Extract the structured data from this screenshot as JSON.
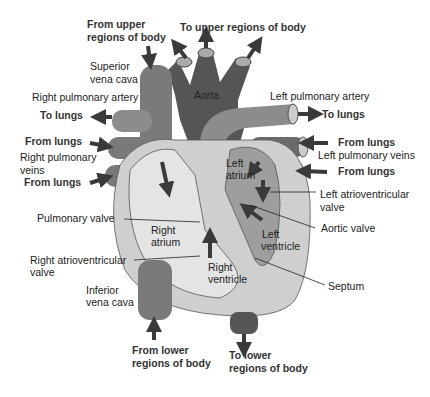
{
  "colors": {
    "background": "#ffffff",
    "deoxygenated_vessel": "#7a7a7a",
    "oxygenated_vessel": "#555555",
    "pulmonary_artery": "#8c8c8c",
    "heart_outer": "#cfcfcf",
    "heart_inner": "#e4e4e4",
    "left_chamber": "#9e9e9e",
    "arrow": "#3a3a3a",
    "text": "#222222"
  },
  "labels": {
    "from_upper_1": "From upper",
    "from_upper_2": "regions of body",
    "to_upper": "To upper regions of body",
    "superior_vc_1": "Superior",
    "superior_vc_2": "vena cava",
    "aorta": "Aorta",
    "right_pulm_artery": "Right pulmonary artery",
    "left_pulm_artery": "Left pulmonary artery",
    "to_lungs_left": "To lungs",
    "to_lungs_right": "To lungs",
    "from_lungs_l1": "From lungs",
    "from_lungs_l2": "From lungs",
    "from_lungs_r1": "From lungs",
    "from_lungs_r2": "From lungs",
    "right_pulm_veins_1": "Right pulmonary",
    "right_pulm_veins_2": "veins",
    "left_pulm_veins": "Left pulmonary veins",
    "left_atrium_1": "Left",
    "left_atrium_2": "atrium",
    "left_av_valve_1": "Left atrioventricular",
    "left_av_valve_2": "valve",
    "pulmonary_valve": "Pulmonary valve",
    "right_atrium_1": "Right",
    "right_atrium_2": "atrium",
    "aortic_valve": "Aortic valve",
    "left_ventricle_1": "Left",
    "left_ventricle_2": "ventricle",
    "right_av_valve_1": "Right atrioventricular",
    "right_av_valve_2": "valve",
    "right_ventricle_1": "Right",
    "right_ventricle_2": "ventricle",
    "septum": "Septum",
    "inferior_vc_1": "Inferior",
    "inferior_vc_2": "vena cava",
    "from_lower_1": "From lower",
    "from_lower_2": "regions of body",
    "to_lower_1": "To lower",
    "to_lower_2": "regions of body"
  }
}
